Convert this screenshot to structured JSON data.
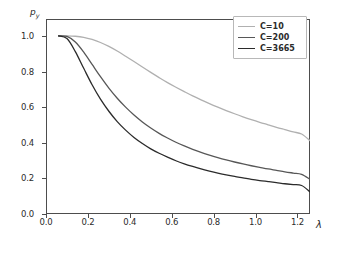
{
  "chart_data": {
    "type": "line",
    "title": "",
    "xlabel": "λ",
    "ylabel": "p",
    "ylabel_sub": "y",
    "xlim": [
      0.0,
      1.26
    ],
    "ylim": [
      0.0,
      1.095
    ],
    "xticks": [
      "0.0",
      "0.2",
      "0.4",
      "0.6",
      "0.8",
      "1.0",
      "1.2"
    ],
    "xtick_values": [
      0.0,
      0.2,
      0.4,
      0.6,
      0.8,
      1.0,
      1.2
    ],
    "yticks": [
      "0.0",
      "0.2",
      "0.4",
      "0.6",
      "0.8",
      "1.0"
    ],
    "ytick_values": [
      0.0,
      0.2,
      0.4,
      0.6,
      0.8,
      1.0
    ],
    "grid": false,
    "legend_position": "upper right",
    "x": [
      0.06,
      0.1,
      0.14,
      0.18,
      0.22,
      0.26,
      0.3,
      0.34,
      0.38,
      0.42,
      0.46,
      0.5,
      0.54,
      0.58,
      0.62,
      0.66,
      0.7,
      0.74,
      0.78,
      0.82,
      0.86,
      0.9,
      0.94,
      0.98,
      1.02,
      1.06,
      1.1,
      1.14,
      1.18,
      1.22,
      1.26
    ],
    "series": [
      {
        "name": "C=10",
        "color": "#b0b0b0",
        "values": [
          1.0,
          1.0,
          0.998,
          0.992,
          0.98,
          0.963,
          0.941,
          0.915,
          0.886,
          0.856,
          0.825,
          0.795,
          0.766,
          0.738,
          0.712,
          0.687,
          0.663,
          0.641,
          0.62,
          0.6,
          0.581,
          0.563,
          0.546,
          0.53,
          0.515,
          0.501,
          0.487,
          0.474,
          0.461,
          0.449,
          0.412
        ]
      },
      {
        "name": "C=200",
        "color": "#575757",
        "values": [
          1.0,
          0.997,
          0.966,
          0.909,
          0.84,
          0.771,
          0.707,
          0.65,
          0.6,
          0.556,
          0.517,
          0.483,
          0.453,
          0.427,
          0.403,
          0.382,
          0.363,
          0.346,
          0.331,
          0.317,
          0.304,
          0.292,
          0.281,
          0.271,
          0.262,
          0.253,
          0.245,
          0.237,
          0.23,
          0.223,
          0.195
        ]
      },
      {
        "name": "C=3665",
        "color": "#2b2b2b",
        "values": [
          1.0,
          0.985,
          0.912,
          0.818,
          0.726,
          0.645,
          0.577,
          0.519,
          0.471,
          0.43,
          0.396,
          0.366,
          0.341,
          0.319,
          0.299,
          0.282,
          0.267,
          0.253,
          0.241,
          0.23,
          0.22,
          0.211,
          0.203,
          0.195,
          0.188,
          0.182,
          0.176,
          0.17,
          0.165,
          0.16,
          0.125
        ]
      }
    ]
  },
  "legend": {
    "entries": [
      {
        "label": "C=10",
        "color": "#b0b0b0"
      },
      {
        "label": "C=200",
        "color": "#575757"
      },
      {
        "label": "C=3665",
        "color": "#2b2b2b"
      }
    ]
  },
  "axes": {
    "frame_color": "#4d4d4d",
    "background": "#ffffff"
  }
}
